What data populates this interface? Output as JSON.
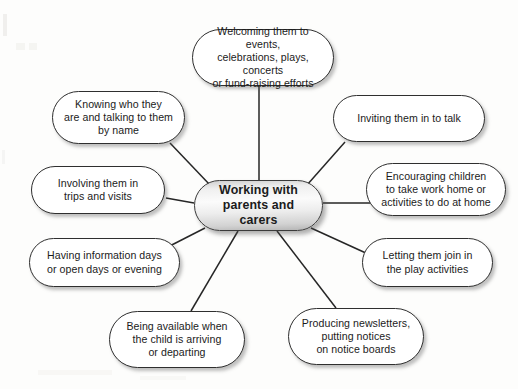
{
  "diagram": {
    "type": "mind-map",
    "title": "Working with parents and carers",
    "center": {
      "id": "center",
      "label": "Working with\nparents and carers"
    },
    "branches": [
      {
        "id": "welcoming",
        "label": "Welcoming them to events,\ncelebrations, plays, concerts\nor fund-raising efforts",
        "position": "top"
      },
      {
        "id": "inviting",
        "label": "Inviting them in to talk",
        "position": "top-right"
      },
      {
        "id": "encouraging",
        "label": "Encouraging children\nto take work home or\nactivities to do at home",
        "position": "right"
      },
      {
        "id": "letting",
        "label": "Letting them join in\nthe play activities",
        "position": "bottom-right"
      },
      {
        "id": "producing",
        "label": "Producing newsletters,\nputting notices\non notice boards",
        "position": "bottom-right-low"
      },
      {
        "id": "being",
        "label": "Being available when\nthe child is arriving\nor departing",
        "position": "bottom-left-low"
      },
      {
        "id": "having",
        "label": "Having information days\nor open days or evening",
        "position": "bottom-left"
      },
      {
        "id": "involving",
        "label": "Involving them in\ntrips and visits",
        "position": "left"
      },
      {
        "id": "knowing",
        "label": "Knowing who they\nare and talking to them\nby name",
        "position": "top-left"
      }
    ],
    "colors": {
      "page_background": "#fdfdfc",
      "node_fill": "#ffffff",
      "node_border": "#2f2f2f",
      "center_fill_light": "#fbfbfb",
      "center_fill_dark": "#b4b4b4",
      "text": "#1b1b1b",
      "edge": "#262626"
    }
  }
}
